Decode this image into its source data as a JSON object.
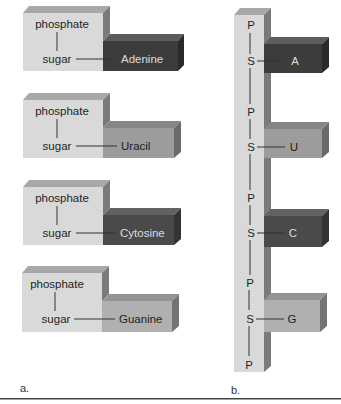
{
  "figure": {
    "panel_a": {
      "label": "a.",
      "nucleotides": [
        {
          "phosphate": "phosphate",
          "sugar": "sugar",
          "base": "Adenine",
          "colors": {
            "front": "#3c3c3c",
            "top": "#5c5c5c",
            "side": "#2a2a2a",
            "text": "#dcdcdc"
          }
        },
        {
          "phosphate": "phosphate",
          "sugar": "sugar",
          "base": "Uracil",
          "colors": {
            "front": "#9c9c9c",
            "top": "#868686",
            "side": "#6a6a6a",
            "text": "#1e1e1e"
          }
        },
        {
          "phosphate": "phosphate",
          "sugar": "sugar",
          "base": "Cytosine",
          "colors": {
            "front": "#4a4a4a",
            "top": "#626262",
            "side": "#333333",
            "text": "#dcdcdc"
          }
        },
        {
          "phosphate": "phosphate",
          "sugar": "sugar",
          "base": "Guanine",
          "colors": {
            "front": "#b0b0b0",
            "top": "#949494",
            "side": "#747474",
            "text": "#1e1e1e"
          }
        }
      ]
    },
    "panel_b": {
      "label": "b.",
      "backbone": [
        "P",
        "S",
        "P",
        "S",
        "P",
        "S",
        "P",
        "S",
        "P"
      ],
      "bases": [
        {
          "letter": "A",
          "colors": {
            "front": "#3c3c3c",
            "top": "#5c5c5c",
            "side": "#2a2a2a",
            "text": "#dcdcdc"
          }
        },
        {
          "letter": "U",
          "colors": {
            "front": "#9c9c9c",
            "top": "#868686",
            "side": "#6a6a6a",
            "text": "#1e1e1e"
          }
        },
        {
          "letter": "C",
          "colors": {
            "front": "#4a4a4a",
            "top": "#626262",
            "side": "#333333",
            "text": "#dcdcdc"
          }
        },
        {
          "letter": "G",
          "colors": {
            "front": "#b0b0b0",
            "top": "#949494",
            "side": "#747474",
            "text": "#1e1e1e"
          }
        }
      ]
    },
    "colors": {
      "sugar_front": "#d9d9d9",
      "sugar_top": "#a8a8a8",
      "sugar_side": "#7a7a7a",
      "rule": "#444444"
    }
  }
}
